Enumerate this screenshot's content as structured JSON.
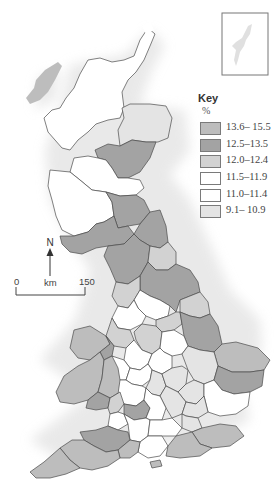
{
  "map": {
    "title": "Regional map of Great Britain",
    "key": {
      "title": "Key",
      "unit": "%",
      "items": [
        {
          "label": "13.6– 15.5",
          "color": "#bdbdbd"
        },
        {
          "label": "12.5–13.5",
          "color": "#a3a3a3"
        },
        {
          "label": "12.0–12.4",
          "color": "#d2d2d2"
        },
        {
          "label": "11.5–11.9",
          "color": "#ffffff"
        },
        {
          "label": "11.0–11.4",
          "color": "#ffffff"
        },
        {
          "label": "9.1– 10.9",
          "color": "#e4e4e4"
        }
      ]
    },
    "north_arrow": {
      "label": "N"
    },
    "scale_bar": {
      "start": "0",
      "unit": "km",
      "end": "150"
    },
    "inset": {
      "name": "Shetland inset"
    },
    "colors": {
      "dark": "#a3a3a3",
      "mid_dark": "#bdbdbd",
      "mid": "#d2d2d2",
      "light": "#e4e4e4",
      "white": "#ffffff",
      "border": "#4a4a4a"
    }
  }
}
